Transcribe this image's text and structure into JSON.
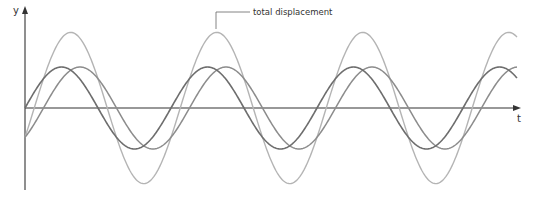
{
  "chart_data": {
    "type": "line",
    "title": "",
    "xlabel": "t",
    "ylabel": "y",
    "grid": false,
    "legend": null,
    "annotations": [
      {
        "text": "total displacement",
        "points_to": "total displacement",
        "position": "top-center"
      }
    ],
    "axes": {
      "origin_px": [
        25,
        108
      ],
      "x_end_px": 521,
      "y_top_px": 8,
      "y_bottom_px": 190
    },
    "series": [
      {
        "name": "wave 1",
        "color": "#6e6e6e",
        "stroke_width": 1.6,
        "amplitude": 41,
        "period": 146,
        "phase_offset_px": 0,
        "x_range_px": [
          25,
          517
        ]
      },
      {
        "name": "wave 2",
        "color": "#8c8c8c",
        "stroke_width": 1.5,
        "amplitude": 41,
        "period": 146,
        "phase_offset_px": 18.5,
        "x_range_px": [
          25,
          517
        ]
      },
      {
        "name": "total displacement",
        "color": "#b4b4b4",
        "stroke_width": 1.4,
        "is_sum": true,
        "amplitude": 75.6,
        "period": 146,
        "x_range_px": [
          25,
          517
        ]
      }
    ]
  },
  "labels": {
    "y_axis": "y",
    "x_axis": "t",
    "annotation": "total displacement"
  },
  "colors": {
    "axis": "#333333",
    "leader_line": "#666666"
  }
}
